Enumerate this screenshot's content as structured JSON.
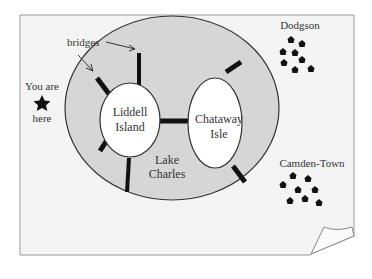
{
  "labels": {
    "bridges": "bridges",
    "you_are": "You are",
    "here": "here",
    "liddell_1": "Liddell",
    "liddell_2": "Island",
    "chataway_1": "Chataway",
    "chataway_2": "Isle",
    "lake_1": "Lake",
    "lake_2": "Charles",
    "dodgson": "Dodgson",
    "camden": "Camden-Town"
  },
  "counts": {
    "bridges": 7,
    "dodgson_houses": 8,
    "camden_houses": 8
  },
  "colors": {
    "paper": "#f4f4f4",
    "lake": "#d6d6d6",
    "island": "#ffffff",
    "bridge": "#111111",
    "outline": "#333333"
  }
}
